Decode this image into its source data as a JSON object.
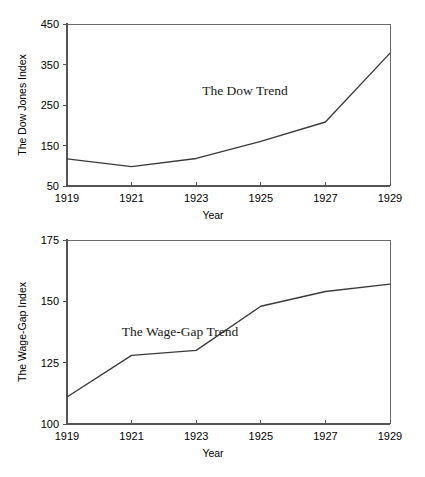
{
  "page": {
    "background": "#ffffff",
    "line_color": "#3a3a3a",
    "axis_color": "#555555"
  },
  "chart_data": [
    {
      "id": "dow",
      "type": "line",
      "title": "The Dow Trend",
      "annotation": "The Dow Trend",
      "xlabel": "Year",
      "ylabel": "The Dow Jones Index",
      "categories": [
        "1919",
        "1921",
        "1923",
        "1925",
        "1927",
        "1929"
      ],
      "x": [
        1919,
        1921,
        1923,
        1925,
        1927,
        1929
      ],
      "values": [
        117,
        98,
        118,
        160,
        208,
        378
      ],
      "series": [
        {
          "name": "The Dow Jones Index",
          "values": [
            117,
            98,
            118,
            160,
            208,
            378
          ]
        }
      ],
      "xlim": [
        1919,
        1929
      ],
      "ylim": [
        50,
        450
      ],
      "yticks": [
        50,
        150,
        250,
        350,
        450
      ],
      "ytick_labels": [
        "50",
        "150",
        "250",
        "350",
        "450"
      ],
      "xticks": [
        1919,
        1921,
        1923,
        1925,
        1927,
        1929
      ],
      "xtick_labels": [
        "1919",
        "1921",
        "1923",
        "1925",
        "1927",
        "1929"
      ],
      "grid": false,
      "legend": "none"
    },
    {
      "id": "wage",
      "type": "line",
      "title": "The Wage-Gap Trend",
      "annotation": "The Wage-Gap Trend",
      "xlabel": "Year",
      "ylabel": "The Wage-Gap Index",
      "categories": [
        "1919",
        "1921",
        "1923",
        "1925",
        "1927",
        "1929"
      ],
      "x": [
        1919,
        1921,
        1923,
        1925,
        1927,
        1929
      ],
      "values": [
        111,
        128,
        130,
        148,
        154,
        157
      ],
      "series": [
        {
          "name": "The Wage-Gap Index",
          "values": [
            111,
            128,
            130,
            148,
            154,
            157
          ]
        }
      ],
      "xlim": [
        1919,
        1929
      ],
      "ylim": [
        100,
        175
      ],
      "yticks": [
        100,
        125,
        150,
        175
      ],
      "ytick_labels": [
        "100",
        "125",
        "150",
        "175"
      ],
      "xticks": [
        1919,
        1921,
        1923,
        1925,
        1927,
        1929
      ],
      "xtick_labels": [
        "1919",
        "1921",
        "1923",
        "1925",
        "1927",
        "1929"
      ],
      "grid": false,
      "legend": "none"
    }
  ]
}
